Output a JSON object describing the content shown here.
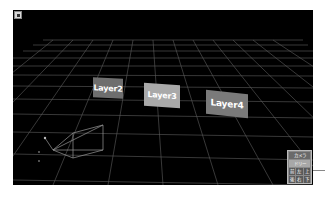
{
  "viewport": {
    "background": "#000000",
    "grid_color": "#6a6a6a"
  },
  "layers": [
    {
      "label": "Layer2",
      "color": "#6e6e6e"
    },
    {
      "label": "Layer3",
      "color": "#a9a9a9"
    },
    {
      "label": "Layer4",
      "color": "#7a7a7a"
    }
  ],
  "camera_widget": {
    "title": "カメラ",
    "mode": "ドリー",
    "row1": [
      "前",
      "左",
      "上"
    ],
    "row2": [
      "後",
      "右",
      "下"
    ]
  }
}
